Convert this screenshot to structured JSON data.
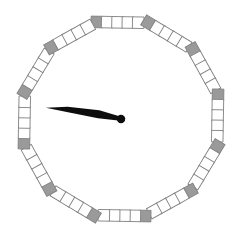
{
  "widget": {
    "name": "polygon-dial-gauge",
    "type": "analog-dial",
    "width": 242,
    "height": 251,
    "background_color": "#ffffff"
  },
  "dial": {
    "shape": "dodecagon",
    "vertex_count": 12,
    "center": {
      "x": 121,
      "y": 119
    },
    "radius": 100,
    "rotation_deg": -14,
    "tiles_per_edge": 5,
    "tile_size": 11.5,
    "tile_border_color": "#808080",
    "tile_border_width": 0.9,
    "vertex_tile_color": "#9a9a9a",
    "edge_tile_color": "#ffffff"
  },
  "needle": {
    "angle_deg": 189,
    "length": 76,
    "max_half_width": 5.2,
    "color": "#0d0d0d",
    "hub_radius": 4.2,
    "hub_color": "#0d0d0d",
    "tail_length": 4
  },
  "chart_data": {
    "type": "pie",
    "title": "",
    "xlabel": "",
    "ylabel": "",
    "categories": [
      "v1",
      "v2",
      "v3",
      "v4",
      "v5",
      "v6",
      "v7",
      "v8",
      "v9",
      "v10",
      "v11",
      "v12"
    ],
    "values": [
      30,
      30,
      30,
      30,
      30,
      30,
      30,
      30,
      30,
      30,
      30,
      30
    ],
    "legend_position": "none",
    "grid": false,
    "annotations": [
      {
        "label": "needle-angle",
        "value": 189,
        "unit": "deg"
      }
    ]
  }
}
